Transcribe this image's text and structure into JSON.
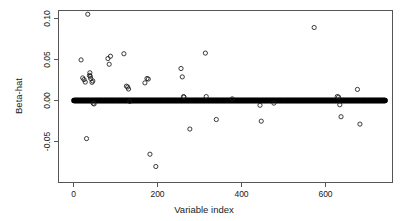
{
  "chart_data": {
    "type": "scatter",
    "title": "",
    "xlabel": "Variable index",
    "ylabel": "Beta-hat",
    "xlim": [
      -30,
      760
    ],
    "ylim": [
      -0.092,
      0.112
    ],
    "xticks": [
      0,
      200,
      400,
      600
    ],
    "xtick_labels": [
      "0",
      "200",
      "400",
      "600"
    ],
    "yticks": [
      -0.05,
      0.0,
      0.05,
      0.1
    ],
    "ytick_labels": [
      "-0.05",
      "0.00",
      "0.05",
      "0.10"
    ],
    "grid": false,
    "legend": null,
    "marker": "open-circle",
    "series": [
      {
        "name": "Beta-hat",
        "points_nonzero": [
          [
            18,
            0.0495
          ],
          [
            22,
            0.0275
          ],
          [
            25,
            0.0255
          ],
          [
            28,
            0.0225
          ],
          [
            31,
            -0.0465
          ],
          [
            34,
            0.1052
          ],
          [
            38,
            0.0305
          ],
          [
            39,
            0.0338
          ],
          [
            40,
            0.0295
          ],
          [
            41,
            0.0268
          ],
          [
            44,
            0.0222
          ],
          [
            46,
            0.0238
          ],
          [
            47,
            -0.0035
          ],
          [
            49,
            -0.0042
          ],
          [
            82,
            0.0512
          ],
          [
            85,
            0.0442
          ],
          [
            88,
            0.054
          ],
          [
            120,
            0.057
          ],
          [
            126,
            0.0175
          ],
          [
            129,
            0.0165
          ],
          [
            131,
            0.014
          ],
          [
            134,
            -0.0012
          ],
          [
            170,
            0.0215
          ],
          [
            175,
            0.0268
          ],
          [
            178,
            0.0262
          ],
          [
            182,
            -0.0655
          ],
          [
            196,
            -0.0805
          ],
          [
            256,
            0.039
          ],
          [
            259,
            0.0288
          ],
          [
            262,
            0.0048
          ],
          [
            263,
            0.0042
          ],
          [
            277,
            -0.0348
          ],
          [
            314,
            0.0578
          ],
          [
            316,
            0.0048
          ],
          [
            340,
            -0.0232
          ],
          [
            378,
            0.002
          ],
          [
            444,
            -0.0058
          ],
          [
            447,
            -0.0252
          ],
          [
            477,
            -0.0032
          ],
          [
            573,
            0.089
          ],
          [
            628,
            0.0048
          ],
          [
            631,
            0.0042
          ],
          [
            634,
            -0.0052
          ],
          [
            637,
            -0.0198
          ],
          [
            676,
            0.0135
          ],
          [
            682,
            -0.0288
          ]
        ],
        "zero_band": {
          "value": 0.0,
          "index_start": 1,
          "index_end": 742,
          "count": 742,
          "description": "contiguous run of zero-valued coefficients rendered as overlapping open circles"
        }
      }
    ]
  }
}
